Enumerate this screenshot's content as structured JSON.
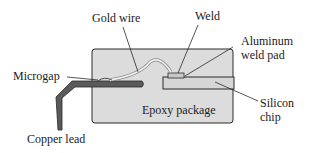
{
  "labels": {
    "gold_wire": "Gold wire",
    "weld": "Weld",
    "aluminum_pad_line1": "Aluminum",
    "aluminum_pad_line2": "weld pad",
    "microgap": "Microgap",
    "epoxy_package": "Epoxy package",
    "silicon_line1": "Silicon",
    "silicon_line2": "chip",
    "copper_lead": "Copper lead"
  },
  "colors": {
    "package_fill": "#dcdcdc",
    "lead_fill": "#5a5a5a",
    "chip_fill": "#d6d6d6",
    "wire": "#ececec",
    "outline": "#2a2a2a"
  }
}
